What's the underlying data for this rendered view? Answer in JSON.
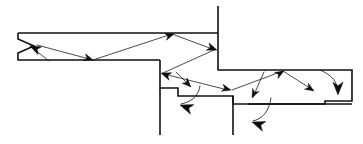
{
  "figure": {
    "type": "line-diagram",
    "width": 363,
    "height": 144,
    "background_color": "#ffffff",
    "boundary_color": "#111111",
    "ray_color": "#2b2b2b",
    "arrowhead_color": "#0d0d0d",
    "boundary_stroke_width": 1.6,
    "ray_stroke_width": 0.85
  },
  "geometry": {
    "upper_channel": {
      "name": "upper-horizontal-channel",
      "top_surface_y": 33,
      "bottom_surface_y": 60,
      "left_x": 18,
      "right_x": 218
    },
    "left_notch": {
      "name": "left-entry-notch",
      "apex_x": 18,
      "apex_y": 46,
      "opening_x": 34
    },
    "vertical_wall": {
      "name": "right-vertical-wall",
      "x": 218,
      "top_y": 6,
      "bottom_y": 55
    },
    "steps": [
      {
        "name": "step-1",
        "top_y": 60,
        "x_start": 160,
        "x_end": 178,
        "drop_y": 88
      },
      {
        "name": "step-2",
        "top_y": 88,
        "x_start": 178,
        "x_end": 233,
        "drop_y": 96
      },
      {
        "name": "step-3",
        "top_y": 96,
        "x_start": 233,
        "x_end": 248,
        "drop_y": 104
      }
    ],
    "right_notch": {
      "name": "right-exit-notch",
      "x_start": 325,
      "x_end": 352,
      "top_y": 70,
      "bottom_y": 101
    },
    "vertical_drop_lines": [
      {
        "name": "left-drop-line",
        "x": 160,
        "y_start": 88,
        "y_end": 135
      },
      {
        "name": "right-drop-line",
        "x": 233,
        "y_start": 96,
        "y_end": 135
      }
    ]
  },
  "boundary_paths": {
    "upper_channel_outline": "M 18 33 L 218 33 M 18 33 L 18 39 L 34 46 L 18 53 L 18 60 L 160 60",
    "wall_and_upper_right": "M 218 6 L 218 60 L 218 70 L 325 70",
    "step_profile": "M 160 60 L 160 88 L 178 88 L 178 96 L 233 96 L 233 104 L 248 104",
    "right_ledge": "M 248 104 L 325 104 L 325 101 L 352 101 L 352 70 L 325 70",
    "lower_right_floor": "M 248 104 L 352 104"
  },
  "rays": [
    {
      "id": "ray-1",
      "name": "ray-incoming-to-left-apex",
      "from": [
        49,
        61
      ],
      "to": [
        30,
        46
      ],
      "arrowhead_at": "to",
      "arrow_direction": "up-left"
    },
    {
      "id": "ray-2",
      "name": "ray-left-apex-to-lower-surface",
      "from": [
        37,
        45
      ],
      "to": [
        93,
        60
      ],
      "arrowhead_at": "to",
      "arrow_direction": "down-right"
    },
    {
      "id": "ray-3",
      "name": "ray-lower-surface-to-upper-surface",
      "from": [
        93,
        60
      ],
      "to": [
        172,
        34
      ],
      "arrowhead_at": "to",
      "arrow_direction": "up-right"
    },
    {
      "id": "ray-4",
      "name": "ray-upper-surface-to-wall",
      "from": [
        172,
        34
      ],
      "to": [
        215,
        50
      ],
      "arrowhead_at": "to",
      "arrow_direction": "down-right"
    },
    {
      "id": "ray-5",
      "name": "ray-wall-to-step-wall",
      "from": [
        214,
        50
      ],
      "to": [
        163,
        73
      ],
      "arrowhead_at": "to",
      "arrow_direction": "down-left"
    },
    {
      "id": "ray-6",
      "name": "ray-step-wall-to-step-ledge",
      "from": [
        164,
        74
      ],
      "to": [
        228,
        90
      ],
      "arrowhead_at": "to",
      "arrow_direction": "down-right"
    },
    {
      "id": "ray-7",
      "name": "ray-step-ledge-to-upper-right-surface",
      "from": [
        232,
        90
      ],
      "to": [
        283,
        71
      ],
      "arrowhead_at": "to",
      "arrow_direction": "up-right"
    },
    {
      "id": "ray-8",
      "name": "ray-upper-right-surface-to-floor",
      "from": [
        283,
        71
      ],
      "to": [
        313,
        90
      ],
      "arrowhead_at": "to",
      "arrow_direction": "down-right"
    },
    {
      "id": "ray-9",
      "name": "ray-branch-into-step1-notch",
      "from": [
        176,
        72
      ],
      "to": [
        190,
        86
      ],
      "arrowhead_at": "to",
      "arrow_direction": "down-right"
    },
    {
      "id": "ray-10",
      "name": "ray-branch-into-step2-notch",
      "from": [
        264,
        72
      ],
      "to": [
        253,
        97
      ],
      "arrowhead_at": "to",
      "arrow_direction": "down-left"
    }
  ],
  "curved_rays": [
    {
      "id": "curve-1",
      "name": "curved-ray-step1-terminal",
      "path": "M 200 86 C 198 98 190 102 181 104",
      "arrowhead_at": "end",
      "arrow_direction": "down-left"
    },
    {
      "id": "curve-2",
      "name": "curved-ray-step2-terminal",
      "path": "M 271 98 C 269 112 262 119 253 121",
      "arrowhead_at": "end",
      "arrow_direction": "down-left"
    },
    {
      "id": "curve-3",
      "name": "curved-ray-right-exit-terminal",
      "path": "M 320 70 C 332 75 338 82 338 93",
      "arrowhead_at": "end",
      "arrow_direction": "down"
    }
  ],
  "arrowheads": [
    {
      "name": "arrowhead-left-apex",
      "tip": [
        30,
        46
      ],
      "angle_deg": 205,
      "size": 11
    },
    {
      "name": "arrowhead-lower-surface-reflect",
      "tip": [
        93,
        60
      ],
      "angle_deg": 18,
      "size": 9
    },
    {
      "name": "arrowhead-upper-surface-reflect",
      "tip": [
        174,
        34
      ],
      "angle_deg": 342,
      "size": 9
    },
    {
      "name": "arrowhead-wall-reflect",
      "tip": [
        217,
        50
      ],
      "angle_deg": 20,
      "size": 10
    },
    {
      "name": "arrowhead-step-wall-reflect",
      "tip": [
        161,
        73
      ],
      "angle_deg": 200,
      "size": 10
    },
    {
      "name": "arrowhead-step-ledge-reflect",
      "tip": [
        231,
        90
      ],
      "angle_deg": 14,
      "size": 9
    },
    {
      "name": "arrowhead-upper-right-reflect",
      "tip": [
        284,
        71
      ],
      "angle_deg": 330,
      "size": 9
    },
    {
      "name": "arrowhead-floor-terminal",
      "tip": [
        314,
        91
      ],
      "angle_deg": 32,
      "size": 9
    },
    {
      "name": "arrowhead-step1-branch",
      "tip": [
        191,
        87
      ],
      "angle_deg": 45,
      "size": 9
    },
    {
      "name": "arrowhead-step2-branch",
      "tip": [
        252,
        98
      ],
      "angle_deg": 115,
      "size": 9
    },
    {
      "name": "arrowhead-step1-terminal",
      "tip": [
        180,
        105
      ],
      "angle_deg": 200,
      "size": 13
    },
    {
      "name": "arrowhead-step2-terminal",
      "tip": [
        252,
        122
      ],
      "angle_deg": 200,
      "size": 13
    },
    {
      "name": "arrowhead-right-exit-terminal",
      "tip": [
        338,
        95
      ],
      "angle_deg": 90,
      "size": 13
    }
  ]
}
